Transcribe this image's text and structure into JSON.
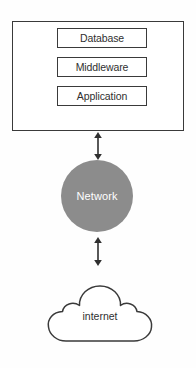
{
  "diagram": {
    "colors": {
      "stroke": "#3a3a3a",
      "network_fill": "#8c8c8c",
      "network_text": "#ffffff",
      "box_fill": "#ffffff",
      "text": "#2f2f2f",
      "background": "#fefefe"
    },
    "system": {
      "name": "system-container",
      "layers": [
        {
          "label": "Database"
        },
        {
          "label": "Middleware"
        },
        {
          "label": "Application"
        }
      ]
    },
    "network": {
      "label": "Network",
      "shape": "circle"
    },
    "internet": {
      "label": "internet",
      "shape": "cloud"
    },
    "connectors": [
      {
        "name": "system-to-network",
        "type": "double-arrow",
        "direction": "vertical"
      },
      {
        "name": "network-to-internet",
        "type": "double-arrow",
        "direction": "vertical"
      }
    ]
  }
}
